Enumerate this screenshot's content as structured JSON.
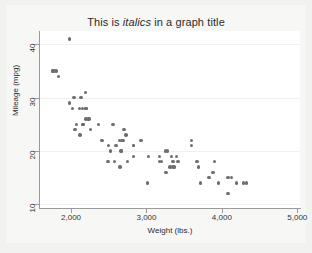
{
  "chart_data": {
    "type": "scatter",
    "title": "This is italics in a graph title",
    "title_parts": {
      "before": "This is ",
      "italic": "italics",
      "after": " in a graph title"
    },
    "xlabel": "Weight (lbs.)",
    "ylabel": "Mileage (mpg)",
    "xlim": [
      1588,
      5036
    ],
    "ylim": [
      9.3,
      42.5
    ],
    "xticks": [
      2000,
      3000,
      4000,
      5000
    ],
    "xtick_labels": [
      "2,000",
      "3,000",
      "4,000",
      "5,000"
    ],
    "yticks": [
      10,
      20,
      30,
      40
    ],
    "ytick_labels": [
      "10",
      "20",
      "30",
      "40"
    ],
    "grid": "horizontal-faint",
    "legend": "none",
    "marker_color": "#6e6e6e",
    "marker_shape": "circle",
    "plot_background": "#ffffff",
    "figure_background": "#f2f2f0",
    "axis_color": "#9a9a9a",
    "n_points": 74,
    "x": [
      2930,
      3350,
      2640,
      3250,
      4080,
      3670,
      2230,
      3280,
      3880,
      3400,
      3015,
      4190,
      3600,
      3600,
      3720,
      3370,
      4130,
      4330,
      3900,
      4290,
      2110,
      2200,
      2150,
      2670,
      2595,
      2700,
      2556,
      2200,
      3030,
      3350,
      2260,
      3330,
      3175,
      2730,
      2830,
      3200,
      2520,
      2580,
      3310,
      2690,
      3420,
      3955,
      3830,
      3260,
      4080,
      3690,
      2830,
      2360,
      2120,
      2160,
      1800,
      2650,
      2500,
      2160,
      2040,
      1760,
      2750,
      2020,
      2130,
      1980,
      2670,
      2190,
      2240,
      2490,
      1980,
      3170,
      2830,
      2070,
      1830,
      1760,
      2050,
      2410,
      2200,
      2660
    ],
    "y": [
      22,
      17,
      22,
      20,
      15,
      18,
      26,
      20,
      16,
      19,
      14,
      14,
      21,
      22,
      14,
      17,
      15,
      14,
      18,
      14,
      28,
      28,
      28,
      22,
      21,
      24,
      25,
      28,
      19,
      18,
      24,
      19,
      18,
      23,
      19,
      18,
      20,
      18,
      17,
      22,
      18,
      14,
      15,
      16,
      12,
      17,
      21,
      25,
      23,
      25,
      35,
      17,
      21,
      25,
      30,
      35,
      18,
      28,
      30,
      29,
      20,
      31,
      26,
      18,
      41,
      19,
      21,
      25,
      34,
      35,
      24,
      22,
      26,
      20
    ],
    "points": [
      {
        "weight": 2930,
        "mpg": 22
      },
      {
        "weight": 3350,
        "mpg": 17
      },
      {
        "weight": 2640,
        "mpg": 22
      },
      {
        "weight": 3250,
        "mpg": 20
      },
      {
        "weight": 4080,
        "mpg": 15
      },
      {
        "weight": 3670,
        "mpg": 18
      },
      {
        "weight": 2230,
        "mpg": 26
      },
      {
        "weight": 3280,
        "mpg": 20
      },
      {
        "weight": 3880,
        "mpg": 16
      },
      {
        "weight": 3400,
        "mpg": 19
      },
      {
        "weight": 3015,
        "mpg": 14
      },
      {
        "weight": 4190,
        "mpg": 14
      },
      {
        "weight": 3600,
        "mpg": 21
      },
      {
        "weight": 3600,
        "mpg": 22
      },
      {
        "weight": 3720,
        "mpg": 14
      },
      {
        "weight": 3370,
        "mpg": 17
      },
      {
        "weight": 4130,
        "mpg": 15
      },
      {
        "weight": 4330,
        "mpg": 14
      },
      {
        "weight": 3900,
        "mpg": 18
      },
      {
        "weight": 4290,
        "mpg": 14
      },
      {
        "weight": 2110,
        "mpg": 28
      },
      {
        "weight": 2200,
        "mpg": 28
      },
      {
        "weight": 2150,
        "mpg": 28
      },
      {
        "weight": 2670,
        "mpg": 22
      },
      {
        "weight": 2595,
        "mpg": 21
      },
      {
        "weight": 2700,
        "mpg": 24
      },
      {
        "weight": 2556,
        "mpg": 25
      },
      {
        "weight": 2200,
        "mpg": 28
      },
      {
        "weight": 3030,
        "mpg": 19
      },
      {
        "weight": 3350,
        "mpg": 18
      },
      {
        "weight": 2260,
        "mpg": 24
      },
      {
        "weight": 3330,
        "mpg": 19
      },
      {
        "weight": 3175,
        "mpg": 18
      },
      {
        "weight": 2730,
        "mpg": 23
      },
      {
        "weight": 2830,
        "mpg": 19
      },
      {
        "weight": 3200,
        "mpg": 18
      },
      {
        "weight": 2520,
        "mpg": 20
      },
      {
        "weight": 2580,
        "mpg": 18
      },
      {
        "weight": 3310,
        "mpg": 17
      },
      {
        "weight": 2690,
        "mpg": 22
      },
      {
        "weight": 3420,
        "mpg": 18
      },
      {
        "weight": 3955,
        "mpg": 14
      },
      {
        "weight": 3830,
        "mpg": 15
      },
      {
        "weight": 3260,
        "mpg": 16
      },
      {
        "weight": 4080,
        "mpg": 12
      },
      {
        "weight": 3690,
        "mpg": 17
      },
      {
        "weight": 2830,
        "mpg": 21
      },
      {
        "weight": 2360,
        "mpg": 25
      },
      {
        "weight": 2120,
        "mpg": 23
      },
      {
        "weight": 2160,
        "mpg": 25
      },
      {
        "weight": 1800,
        "mpg": 35
      },
      {
        "weight": 2650,
        "mpg": 17
      },
      {
        "weight": 2500,
        "mpg": 21
      },
      {
        "weight": 2160,
        "mpg": 25
      },
      {
        "weight": 2040,
        "mpg": 30
      },
      {
        "weight": 1760,
        "mpg": 35
      },
      {
        "weight": 2750,
        "mpg": 18
      },
      {
        "weight": 2020,
        "mpg": 28
      },
      {
        "weight": 2130,
        "mpg": 30
      },
      {
        "weight": 1980,
        "mpg": 29
      },
      {
        "weight": 2670,
        "mpg": 20
      },
      {
        "weight": 2190,
        "mpg": 31
      },
      {
        "weight": 2240,
        "mpg": 26
      },
      {
        "weight": 2490,
        "mpg": 18
      },
      {
        "weight": 1980,
        "mpg": 41
      },
      {
        "weight": 3170,
        "mpg": 19
      },
      {
        "weight": 2830,
        "mpg": 21
      },
      {
        "weight": 2070,
        "mpg": 25
      },
      {
        "weight": 1830,
        "mpg": 34
      },
      {
        "weight": 1760,
        "mpg": 35
      },
      {
        "weight": 2050,
        "mpg": 24
      },
      {
        "weight": 2410,
        "mpg": 22
      },
      {
        "weight": 2200,
        "mpg": 26
      },
      {
        "weight": 2660,
        "mpg": 20
      }
    ]
  }
}
